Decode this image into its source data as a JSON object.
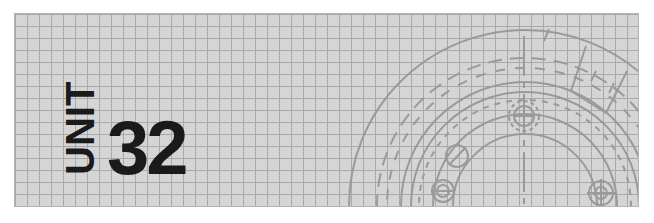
{
  "header": {
    "unit_label": "UNIT",
    "unit_number": "32"
  },
  "colors": {
    "background": "#ffffff",
    "panel_fill": "#d5d5d5",
    "grid_line": "#a9a9a9",
    "drawing_line": "#9a9a9a",
    "text": "#1a1a1a"
  },
  "decoration": {
    "grid_cell_px": 12,
    "drawing": "technical-drawing-flange"
  }
}
